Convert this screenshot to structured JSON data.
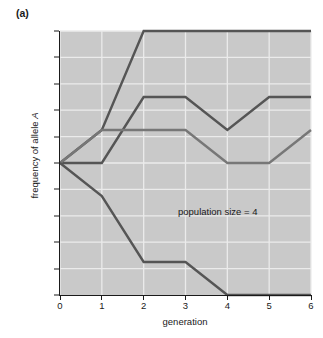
{
  "figure": {
    "panel_label": "(a)",
    "background_color": "#ffffff",
    "plot_background_color": "#c9c9c9",
    "gridline_color": "#ebebeb",
    "axis_color": "#1a1a1a"
  },
  "annotation": {
    "text": "population size = 4"
  },
  "chart_data": {
    "type": "line",
    "title": "(a)",
    "xlabel": "generation",
    "ylabel": "frequency of allele A",
    "xlim": [
      0,
      6
    ],
    "ylim": [
      0,
      1
    ],
    "grid": true,
    "legend": "none",
    "x": [
      0,
      1,
      2,
      3,
      4,
      5,
      6
    ],
    "xticks": [
      "0",
      "1",
      "2",
      "3",
      "4",
      "5",
      "6"
    ],
    "yticks": [
      "0.0",
      "0.1",
      "0.2",
      "0.3",
      "0.4",
      "0.5",
      "0.6",
      "0.7",
      "0.8",
      "0.9",
      "1.0"
    ],
    "ytick_values": [
      0.0,
      0.1,
      0.2,
      0.3,
      0.4,
      0.5,
      0.6,
      0.7,
      0.8,
      0.9,
      1.0
    ],
    "annotations": [
      {
        "text": "population size = 4",
        "x": 3.3,
        "y": 0.26
      }
    ],
    "series": [
      {
        "name": "replicate-1-fixation",
        "color": "#555555",
        "values": [
          0.5,
          0.625,
          1.0,
          1.0,
          1.0,
          1.0,
          1.0
        ]
      },
      {
        "name": "replicate-2-upper",
        "color": "#555555",
        "values": [
          0.5,
          0.5,
          0.75,
          0.75,
          0.625,
          0.75,
          0.75
        ]
      },
      {
        "name": "replicate-3-middle",
        "color": "#777777",
        "values": [
          0.5,
          0.625,
          0.625,
          0.625,
          0.5,
          0.5,
          0.625
        ]
      },
      {
        "name": "replicate-4-loss",
        "color": "#555555",
        "values": [
          0.5,
          0.375,
          0.125,
          0.125,
          0.0,
          0.0,
          0.0
        ]
      }
    ]
  }
}
